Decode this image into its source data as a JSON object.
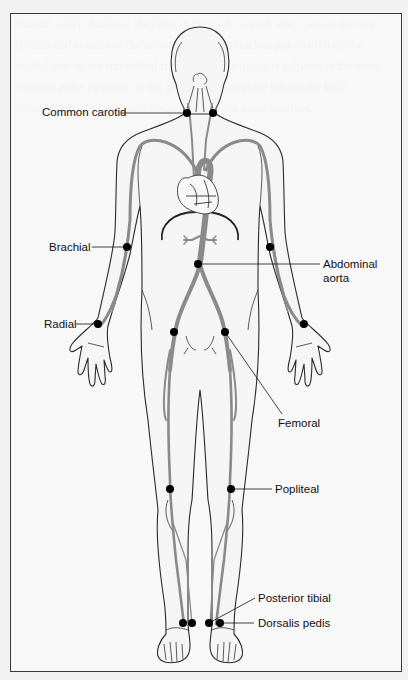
{
  "figure": {
    "labels": {
      "common_carotid": "Common carotid",
      "brachial": "Brachial",
      "radial": "Radial",
      "abdominal_aorta_line1": "Abdominal",
      "abdominal_aorta_line2": "aorta",
      "femoral": "Femoral",
      "popliteal": "Popliteal",
      "posterior_tibial": "Posterior tibial",
      "dorsalis_pedis": "Dorsalis pedis"
    },
    "pulse_points": [
      {
        "name": "Common carotid",
        "x": [
          187,
          213
        ],
        "y": 113
      },
      {
        "name": "Brachial",
        "x": [
          127,
          270
        ],
        "y": 247
      },
      {
        "name": "Abdominal aorta",
        "x": [
          198
        ],
        "y": 264
      },
      {
        "name": "Radial",
        "x": [
          98,
          304
        ],
        "y": 324
      },
      {
        "name": "Femoral",
        "x": [
          174,
          225
        ],
        "y": 332
      },
      {
        "name": "Popliteal",
        "x": [
          170,
          231
        ],
        "y": 489
      },
      {
        "name": "Posterior tibial",
        "x": [
          183,
          209
        ],
        "y": 623
      },
      {
        "name": "Dorsalis pedis",
        "x": [
          192,
          220
        ],
        "y": 623
      }
    ],
    "colors": {
      "artery": "#8a8a8a",
      "outline": "#2a2a2a",
      "dot": "#000000",
      "body_fill": "#f4f4f4"
    }
  },
  "background_text": "Carotid artery. Examine the pulse in the neck on each side... assess the rate, rhythm and volume of the arterial pulse. The brachial pulse is felt on the medial side of the antecubital fossa. The radial pulse is palpated at the wrist. Femoral pulse palpation in the groin. Popliteal pulse behind the knee. Posterior tibial and dorsalis pedis pulses at the ankle and foot."
}
